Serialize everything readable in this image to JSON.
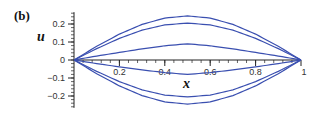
{
  "panel_label": "(b)",
  "chart_data": {
    "type": "line",
    "title": "",
    "panel": "(b)",
    "xlabel": "x",
    "ylabel": "u",
    "xlim": [
      0,
      1
    ],
    "ylim": [
      -0.26,
      0.26
    ],
    "x_ticks": [
      0.2,
      0.4,
      0.6,
      0.8,
      1
    ],
    "x_tick_labels": [
      "0.2",
      "0.4",
      "0.6",
      "0.8",
      "1"
    ],
    "y_ticks": [
      0.2,
      0.1,
      0,
      -0.1,
      -0.2
    ],
    "y_tick_labels": [
      "0.2",
      "0.1",
      "0",
      "−0.1",
      "−0.2"
    ],
    "grid": false,
    "legend": null,
    "line_color": "#3a4fb0",
    "x": [
      0,
      0.1,
      0.2,
      0.3,
      0.4,
      0.5,
      0.6,
      0.7,
      0.8,
      0.9,
      1
    ],
    "series": [
      {
        "name": "curve-1",
        "peak": 0.245,
        "values": [
          0,
          0.076,
          0.144,
          0.198,
          0.233,
          0.245,
          0.233,
          0.198,
          0.144,
          0.076,
          0
        ]
      },
      {
        "name": "curve-2",
        "peak": 0.205,
        "values": [
          0,
          0.063,
          0.12,
          0.166,
          0.195,
          0.205,
          0.195,
          0.166,
          0.12,
          0.063,
          0
        ]
      },
      {
        "name": "curve-3",
        "peak": 0.09,
        "values": [
          0,
          0.022,
          0.042,
          0.062,
          0.079,
          0.09,
          0.079,
          0.062,
          0.042,
          0.022,
          0
        ]
      },
      {
        "name": "curve-4",
        "peak": -0.08,
        "values": [
          0,
          -0.02,
          -0.038,
          -0.055,
          -0.07,
          -0.08,
          -0.07,
          -0.055,
          -0.038,
          -0.02,
          0
        ]
      },
      {
        "name": "curve-5",
        "peak": -0.205,
        "values": [
          0,
          -0.063,
          -0.12,
          -0.166,
          -0.195,
          -0.205,
          -0.195,
          -0.166,
          -0.12,
          -0.063,
          0
        ]
      },
      {
        "name": "curve-6",
        "peak": -0.245,
        "values": [
          0,
          -0.076,
          -0.144,
          -0.198,
          -0.233,
          -0.245,
          -0.233,
          -0.198,
          -0.144,
          -0.076,
          0
        ]
      }
    ]
  }
}
